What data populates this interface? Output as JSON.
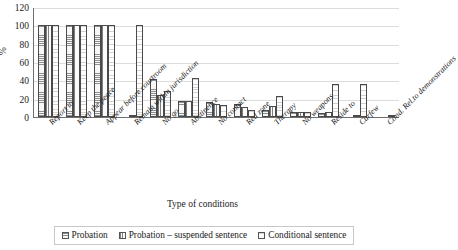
{
  "chart_data": {
    "type": "bar",
    "title": "",
    "xlabel": "Type of conditions",
    "ylabel": "%",
    "ylim": [
      0,
      120
    ],
    "yticks": [
      0,
      20,
      40,
      60,
      80,
      100,
      120
    ],
    "grid": true,
    "legend_position": "bottom",
    "categories": [
      "Report to",
      "Keep the peace",
      "Appear before courtroom",
      "Remain within jurisdiction",
      "No go",
      "Abstinence",
      "No contact",
      "Red zone",
      "Therapy",
      "No weapons",
      "Reside to",
      "Curfew",
      "Cond. Rel.to demonstrations"
    ],
    "series": [
      {
        "name": "Probation",
        "fill": "horizontal-lines",
        "color": "#8d8d8d",
        "values": [
          100,
          100,
          100,
          0,
          41,
          18,
          16,
          14,
          8,
          5,
          4,
          0,
          0
        ]
      },
      {
        "name": "Probation – suspended sentence",
        "fill": "vertical-lines",
        "color": "#7e7e7e",
        "values": [
          100,
          100,
          100,
          2,
          24,
          18,
          14,
          11,
          12,
          5,
          5,
          1,
          0
        ]
      },
      {
        "name": "Conditional sentence",
        "fill": "light-dots",
        "color": "#d2d2d2",
        "values": [
          100,
          100,
          100,
          100,
          28,
          43,
          13,
          8,
          23,
          6,
          36,
          36,
          1
        ]
      }
    ]
  },
  "axis": {
    "y_title": "%",
    "x_title": "Type of conditions"
  },
  "legend": {
    "items": [
      {
        "label": "Probation"
      },
      {
        "label": "Probation – suspended sentence"
      },
      {
        "label": "Conditional sentence"
      }
    ]
  }
}
